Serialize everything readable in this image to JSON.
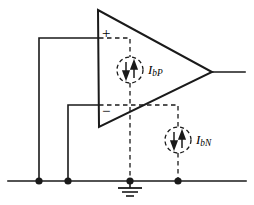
{
  "figure": {
    "background_color": "#ffffff",
    "line_color": "#1a1a1a",
    "width": 254,
    "height": 205
  },
  "opamp": {
    "name": "operational-amplifier",
    "shape": "triangle",
    "apex_top": [
      98,
      10
    ],
    "apex_bottom": [
      99,
      127
    ],
    "tip": [
      212,
      72
    ],
    "noninverting_sign": "+",
    "inverting_sign": "−"
  },
  "sources": [
    {
      "id": "ibp",
      "label": "I",
      "sublabel": "bP",
      "description": "non-inverting input bias current source",
      "center": [
        130,
        70
      ],
      "radius": 13,
      "style": "dashed",
      "arrows": [
        "down",
        "up"
      ]
    },
    {
      "id": "ibn",
      "label": "I",
      "sublabel": "bN",
      "description": "inverting input bias current source",
      "center": [
        178,
        140
      ],
      "radius": 13,
      "style": "dashed",
      "arrows": [
        "down",
        "up"
      ]
    }
  ],
  "nodes": [
    {
      "id": "node-vp-source",
      "x": 39,
      "y": 181
    },
    {
      "id": "node-vn-source",
      "x": 68,
      "y": 181
    },
    {
      "id": "node-ground",
      "x": 130,
      "y": 181
    },
    {
      "id": "node-ibn-return",
      "x": 178,
      "y": 181
    }
  ],
  "ground": {
    "name": "ground-symbol",
    "x": 130,
    "y": 181
  },
  "rails": {
    "bottom_bus_y": 181,
    "bottom_bus_x1": 8,
    "bottom_bus_x2": 246
  },
  "output": {
    "name": "output-terminal",
    "from": [
      212,
      72
    ],
    "to": [
      245,
      72
    ]
  },
  "inputs": [
    {
      "id": "noninverting-input",
      "pin_y": 38,
      "drop_x": 39
    },
    {
      "id": "inverting-input",
      "pin_y": 105,
      "drop_x": 68
    }
  ]
}
